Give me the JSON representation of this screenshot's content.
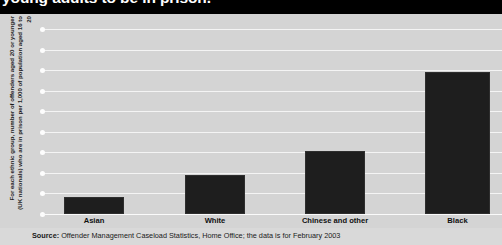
{
  "title": {
    "text": "young adults to be in prison.",
    "clipped": true
  },
  "footer": {
    "label": "Source:",
    "text": " Offender Management Caseload Statistics, Home Office; the data is for February 2003"
  },
  "colors": {
    "background": "#d4d4d4",
    "title_band": "#000000",
    "title_text": "#ffffff",
    "bar": "#1e1e1e",
    "gridline": "#f4f4f4",
    "footer_background": "#d9d9d9"
  },
  "chart_data": {
    "type": "bar",
    "title": "young adults to be in prison.",
    "xlabel": "",
    "ylabel": "For each ethnic group, number of offenders aged 20 or younger (UK nationals) who are in prison per 1,000 of population aged 16 to 20",
    "categories": [
      "Asian",
      "White",
      "Chinese and other",
      "Black"
    ],
    "values": [
      0.9,
      2.1,
      3.4,
      7.7
    ],
    "ylim": [
      0,
      10
    ],
    "ytick_labels": [],
    "gridlines": 10,
    "grid": true,
    "legend": null,
    "annotations": []
  }
}
